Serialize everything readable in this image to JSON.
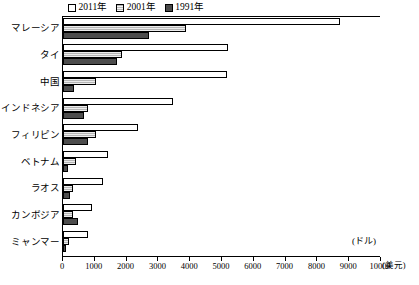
{
  "chart_data": {
    "type": "bar",
    "orientation": "horizontal",
    "title": "",
    "xlabel": "(ドル)",
    "xlabel_secondary": "(美元)",
    "ylabel": "",
    "xlim": [
      0,
      10000
    ],
    "xticks": [
      0,
      1000,
      2000,
      3000,
      4000,
      5000,
      6000,
      7000,
      8000,
      9000,
      10000
    ],
    "xtick_labels": [
      "0",
      "1000",
      "2000",
      "3000",
      "4000",
      "5000",
      "6000",
      "7000",
      "8000",
      "9000",
      "10000"
    ],
    "grid": false,
    "legend_position": "top",
    "categories": [
      "マレーシア",
      "タイ",
      "中国",
      "インドネシア",
      "フィリピン",
      "ベトナム",
      "ラオス",
      "カンボジア",
      "ミャンマー"
    ],
    "series": [
      {
        "name": "2011年",
        "color": "#ffffff",
        "pattern": "empty",
        "values": [
          8700,
          5200,
          5150,
          3470,
          2370,
          1400,
          1250,
          900,
          800
        ]
      },
      {
        "name": "2001年",
        "color": "#b5b5b5",
        "pattern": "hatch",
        "values": [
          3870,
          1870,
          1050,
          780,
          1050,
          420,
          330,
          300,
          180
        ]
      },
      {
        "name": "1991年",
        "color": "#4d4d4d",
        "pattern": "solid",
        "values": [
          2700,
          1700,
          350,
          650,
          800,
          150,
          230,
          480,
          80
        ]
      }
    ]
  }
}
